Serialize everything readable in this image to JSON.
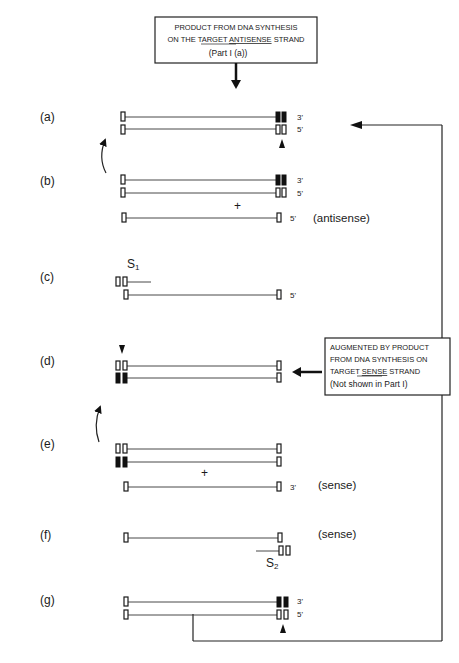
{
  "top_box": {
    "line1": "PRODUCT FROM DNA SYNTHESIS",
    "line2_pre": "ON THE TARGET ",
    "line2_u": "ANTISENSE",
    "line2_post": " STRAND",
    "line3": "(Part  I (a))"
  },
  "side_box": {
    "line1": "AUGMENTED BY PRODUCT",
    "line2": "FROM DNA SYNTHESIS ON",
    "line3_pre": "TARGET ",
    "line3_u": "SENSE",
    "line3_post": " STRAND",
    "line4": "(Not  shown  in  Part   I)"
  },
  "steps": {
    "a": {
      "label": "(a)",
      "top_end": "3'",
      "bottom_end": "5'"
    },
    "b": {
      "label": "(b)",
      "top_end": "3'",
      "bottom_end": "5'",
      "plus": "+",
      "third_end": "5'",
      "note": "(antisense)"
    },
    "c": {
      "label": "(c)",
      "primer": "S",
      "primer_sub": "1",
      "strand_end": "5'"
    },
    "d": {
      "label": "(d)"
    },
    "e": {
      "label": "(e)",
      "plus": "+",
      "third_end": "3'",
      "note": "(sense)"
    },
    "f": {
      "label": "(f)",
      "note": "(sense)",
      "primer": "S",
      "primer_sub": "2"
    },
    "g": {
      "label": "(g)",
      "top_end": "3'",
      "bottom_end": "5'"
    }
  },
  "colors": {
    "ink": "#1a1a1a",
    "background": "#ffffff"
  }
}
